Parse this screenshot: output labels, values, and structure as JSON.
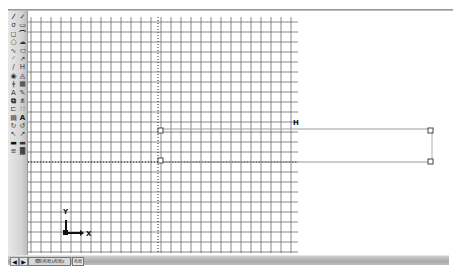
{
  "app": {
    "type": "CAD drawing workspace"
  },
  "toolbar": {
    "tools": [
      {
        "icon": "line-icon",
        "glyph": "⁄"
      },
      {
        "icon": "construction-line-icon",
        "glyph": "✓"
      },
      {
        "icon": "polyline-icon",
        "glyph": "σ"
      },
      {
        "icon": "polygon-icon",
        "glyph": "▭"
      },
      {
        "icon": "rectangle-icon",
        "glyph": "◻"
      },
      {
        "icon": "arc-icon",
        "glyph": "⌒"
      },
      {
        "icon": "circle-icon",
        "glyph": "○"
      },
      {
        "icon": "revision-cloud-icon",
        "glyph": "☁"
      },
      {
        "icon": "spline-icon",
        "glyph": "∿"
      },
      {
        "icon": "ellipse-icon",
        "glyph": "⬭"
      },
      {
        "icon": "ellipse-arc-icon",
        "glyph": "◜"
      },
      {
        "icon": "insert-block-icon",
        "glyph": "↗"
      },
      {
        "icon": "make-block-icon",
        "glyph": "/"
      },
      {
        "icon": "point-icon",
        "glyph": "H"
      },
      {
        "icon": "hatch-icon",
        "glyph": "◉"
      },
      {
        "icon": "gradient-icon",
        "glyph": "◬"
      },
      {
        "icon": "region-icon",
        "glyph": "ǂ"
      },
      {
        "icon": "table-icon",
        "glyph": "▦"
      },
      {
        "icon": "multiline-text-icon",
        "glyph": "A"
      },
      {
        "icon": "erase-icon",
        "glyph": "✎"
      },
      {
        "icon": "copy-icon",
        "glyph": "⧉"
      },
      {
        "icon": "mirror-icon",
        "glyph": "⋔"
      },
      {
        "icon": "offset-icon",
        "glyph": "⊏"
      },
      {
        "icon": "array-icon",
        "glyph": "∷"
      },
      {
        "icon": "move-icon",
        "glyph": "▤"
      },
      {
        "icon": "rotate-icon",
        "glyph": "A"
      },
      {
        "icon": "scale-icon",
        "glyph": "↻"
      },
      {
        "icon": "stretch-icon",
        "glyph": "↺"
      },
      {
        "icon": "trim-icon",
        "glyph": "↖"
      },
      {
        "icon": "extend-icon",
        "glyph": "↗"
      },
      {
        "icon": "break-icon",
        "glyph": "▬"
      },
      {
        "icon": "join-icon",
        "glyph": "▬"
      },
      {
        "icon": "chamfer-icon",
        "glyph": "≡"
      },
      {
        "icon": "fillet-icon",
        "glyph": "▓"
      }
    ]
  },
  "drawing": {
    "marker_label": "H",
    "ucs": {
      "x_label": "X",
      "y_label": "Y"
    }
  },
  "status_bar": {
    "prev_label": "◀",
    "next_label": "▶",
    "layout_tab_label": "模型/布局1/布局2",
    "small_tab_label": "布局"
  }
}
